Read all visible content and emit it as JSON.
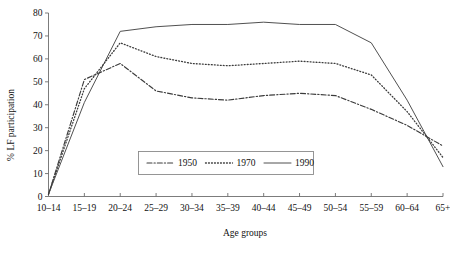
{
  "chart_data": {
    "type": "line",
    "title": "",
    "xlabel": "Age groups",
    "ylabel": "% LF participation",
    "categories": [
      "10–14",
      "15–19",
      "20–24",
      "25–29",
      "30–34",
      "35–39",
      "40–44",
      "45–49",
      "50–54",
      "55–59",
      "60–64",
      "65+"
    ],
    "ylim": [
      0,
      80
    ],
    "yticks": [
      0,
      10,
      20,
      30,
      40,
      50,
      60,
      70,
      80
    ],
    "ytick_labels": [
      "0",
      "10",
      "20",
      "30",
      "40",
      "50",
      "60",
      "70",
      "80"
    ],
    "grid": false,
    "legend_position": "inside-bottom-center",
    "series": [
      {
        "name": "1950",
        "dash": "dash-dot",
        "values": [
          1,
          51,
          58,
          46,
          43,
          42,
          44,
          45,
          44,
          38,
          31,
          22
        ]
      },
      {
        "name": "1970",
        "dash": "dotted",
        "values": [
          1,
          47,
          67,
          61,
          58,
          57,
          58,
          59,
          58,
          53,
          37,
          17
        ]
      },
      {
        "name": "1990",
        "dash": "solid",
        "values": [
          1,
          41,
          72,
          74,
          75,
          75,
          76,
          75,
          75,
          67,
          42,
          13
        ]
      }
    ]
  },
  "legend": {
    "entries": [
      {
        "label": "1950"
      },
      {
        "label": "1970"
      },
      {
        "label": "1990"
      }
    ]
  },
  "colors": {
    "axis": "#6d6d6d",
    "series": "#3c3c3c",
    "legend_border": "#8a8a8a",
    "text": "#111111",
    "background": "#ffffff"
  }
}
